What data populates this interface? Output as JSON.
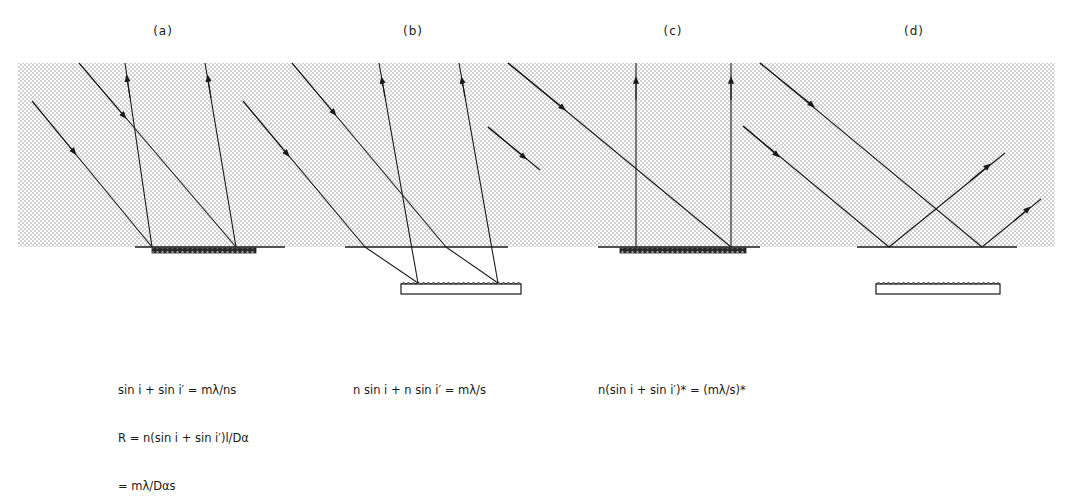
{
  "figure": {
    "panels": [
      {
        "id": "a",
        "label": "(a)",
        "label_x": 163,
        "equations": [
          "sin i + sin i′ = mλ/ns",
          "R = n(sin i + sin i′)l/Dα",
          "= mλ/Dαs"
        ],
        "eq_x": 118,
        "eq_y": 350
      },
      {
        "id": "b",
        "label": "(b)",
        "label_x": 413,
        "equations": [
          "n sin i + n sin i′ = mλ/s"
        ],
        "eq_x": 353,
        "eq_y": 350
      },
      {
        "id": "c",
        "label": "(c)",
        "label_x": 673,
        "equations": [
          "n(sin i + sin i′)* = (mλ/s)*"
        ],
        "eq_x": 598,
        "eq_y": 350
      },
      {
        "id": "d",
        "label": "(d)",
        "label_x": 914,
        "equations": [],
        "eq_x": 0,
        "eq_y": 0
      }
    ],
    "colors": {
      "line": "#1a1a1a",
      "stipple_dot": "#9a9a9a",
      "background": "#ffffff"
    }
  }
}
